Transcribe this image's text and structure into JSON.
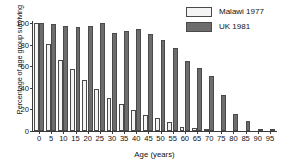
{
  "chart_data": {
    "type": "bar",
    "title": "",
    "xlabel": "Age (years)",
    "ylabel": "Percentage of age group surviving",
    "categories": [
      "0",
      "5",
      "10",
      "15",
      "20",
      "25",
      "30",
      "35",
      "40",
      "45",
      "50",
      "55",
      "60",
      "65",
      "70",
      "75",
      "80",
      "85",
      "90",
      "95"
    ],
    "series": [
      {
        "name": "Malawi 1977",
        "color": "#f4f4f4",
        "values": [
          100,
          81,
          66,
          57,
          47,
          39,
          31,
          25,
          19,
          15,
          12,
          8,
          4,
          3,
          1,
          0,
          0,
          0,
          0,
          0
        ]
      },
      {
        "name": "UK 1981",
        "color": "#6d6d6d",
        "values": [
          100,
          99,
          97,
          96,
          97,
          100,
          91,
          93,
          94,
          90,
          84,
          77,
          65,
          58,
          51,
          33,
          16,
          9,
          2,
          1
        ]
      }
    ],
    "ylim": [
      0,
      100
    ],
    "yticks": [
      0,
      20,
      40,
      60,
      80,
      100
    ],
    "grid": false,
    "legend_position": "top-right"
  },
  "legend": {
    "items": [
      {
        "label": "Malawi 1977"
      },
      {
        "label": "UK 1981"
      }
    ]
  },
  "axes": {
    "y_title": "Percentage of age group surviving",
    "x_title": "Age (years)"
  }
}
